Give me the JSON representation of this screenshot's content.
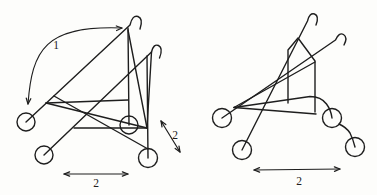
{
  "canvas": {
    "width": 377,
    "height": 195,
    "background": "#fdfdfb",
    "stroke_color": "#1e1e1e",
    "stroke_width": 1.4,
    "label_color": "#1e1e1e",
    "label_font_size": 11.5,
    "arrow_head_size": 6,
    "arrow_head_spread_deg": 22
  },
  "diagrams": [
    {
      "name": "stroller-unfolded",
      "wheels": [
        {
          "name": "rear-left-wheel",
          "cx": 26,
          "cy": 122,
          "r": 9
        },
        {
          "name": "front-left-wheel",
          "cx": 44,
          "cy": 155,
          "r": 9
        },
        {
          "name": "rear-right-wheel",
          "cx": 129,
          "cy": 125,
          "r": 9
        },
        {
          "name": "front-right-wheel",
          "cx": 148,
          "cy": 158,
          "r": 9.5
        }
      ],
      "frame_paths": [
        {
          "name": "handle-tube-1",
          "d": "M 26 122 L 130 25 Q 132.5 14.5 138 16.5 Q 143.5 18.5 140 29"
        },
        {
          "name": "handle-tube-2",
          "d": "M 44 155 L 151.5 52 Q 153.5 43.5 158.5 45.5 Q 163.5 48 159.5 58"
        },
        {
          "name": "front-leg",
          "d": "M 128 28 L 129 125"
        },
        {
          "name": "rear-leg",
          "d": "M 147 56 L 148 158"
        },
        {
          "name": "seat-rail-upper",
          "d": "M 46 103 L 128 100"
        },
        {
          "name": "seat-rail-lower",
          "d": "M 74 128 L 147 128"
        },
        {
          "name": "side-brace-1",
          "d": "M 46 103 L 147 128"
        },
        {
          "name": "side-brace-2",
          "d": "M 54 96 L 148 149"
        },
        {
          "name": "fold-strut-1",
          "d": "M 128 30 L 147 128"
        },
        {
          "name": "fold-strut-2",
          "d": "M 151.5 52 L 147 128"
        }
      ],
      "arrows": [
        {
          "name": "fold-motion-arrow",
          "type": "curve",
          "d": "M 28 104 C 32 50, 45 25, 122 28",
          "heads": [
            {
              "x": 28,
              "y": 104,
              "angle": 96
            },
            {
              "x": 122,
              "y": 28,
              "angle": -3
            }
          ],
          "label": {
            "text": "1",
            "x": 56,
            "y": 49
          }
        },
        {
          "name": "fold-direction-arrow",
          "type": "line",
          "x1": 161,
          "y1": 121,
          "x2": 180,
          "y2": 152,
          "label": {
            "text": "2",
            "x": 175,
            "y": 139
          }
        },
        {
          "name": "width-dimension-arrow",
          "type": "line",
          "x1": 64,
          "y1": 174,
          "x2": 128,
          "y2": 174,
          "label": {
            "text": "2",
            "x": 96,
            "y": 187
          }
        }
      ]
    },
    {
      "name": "stroller-folded",
      "wheels": [
        {
          "name": "rear-left-wheel",
          "cx": 222,
          "cy": 118,
          "r": 9.5
        },
        {
          "name": "front-left-wheel",
          "cx": 242,
          "cy": 150,
          "r": 9.5
        },
        {
          "name": "rear-right-wheel",
          "cx": 332,
          "cy": 118,
          "r": 9.5
        },
        {
          "name": "front-right-wheel",
          "cx": 355,
          "cy": 147,
          "r": 9.5
        }
      ],
      "frame_paths": [
        {
          "name": "handle-tube-1",
          "d": "M 242 150 L 307.5 21 Q 309.5 12.5 314.5 14 Q 319.5 16 316 25"
        },
        {
          "name": "handle-tube-2",
          "d": "M 222 118 L 335.5 40 Q 339 32 343.5 34.5 Q 348 37.5 344 45"
        },
        {
          "name": "seat-back-panel",
          "d": "M 288 103 L 288 50 L 298 38 L 315 61 L 315 112"
        },
        {
          "name": "seat-rail-upper",
          "d": "M 234 107.5 L 310 96.5 Q 321 96.5 326.5 104 Q 331 110 332 118"
        },
        {
          "name": "seat-rail-lower",
          "d": "M 234 107.5 L 316 114"
        },
        {
          "name": "side-brace",
          "d": "M 234 107.5 L 315 62"
        },
        {
          "name": "folded-rear-leg",
          "d": "M 339 124 Q 346 127 350 133 Q 353 139 355 147"
        }
      ],
      "arrows": [
        {
          "name": "width-dimension-arrow",
          "type": "line",
          "x1": 254,
          "y1": 170,
          "x2": 340,
          "y2": 169,
          "label": {
            "text": "2",
            "x": 299,
            "y": 185
          }
        }
      ]
    }
  ]
}
